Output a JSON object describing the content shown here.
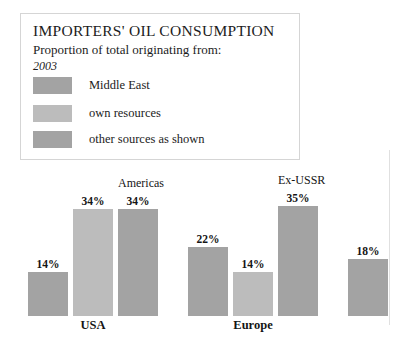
{
  "legend": {
    "title": "IMPORTERS' OIL CONSUMPTION",
    "subtitle": "Proportion of total originating from:",
    "year": "2003",
    "items": [
      {
        "label": "Middle East",
        "color": "#a3a3a3"
      },
      {
        "label": "own resources",
        "color": "#bcbcbc"
      },
      {
        "label": "other sources as shown",
        "color": "#a3a3a3"
      }
    ]
  },
  "chart_data": {
    "type": "bar",
    "title": "IMPORTERS' OIL CONSUMPTION",
    "subtitle": "Proportion of total originating from:",
    "year": "2003",
    "xlabel": "",
    "ylabel": "",
    "ylim": [
      0,
      40
    ],
    "grid": false,
    "legend_position": "top-left",
    "series": [
      {
        "name": "Middle East",
        "color": "#a3a3a3"
      },
      {
        "name": "own resources",
        "color": "#bcbcbc"
      },
      {
        "name": "other sources as shown",
        "color": "#a3a3a3"
      }
    ],
    "groups": [
      {
        "name": "USA",
        "bars": [
          {
            "value": 14,
            "label": "14%",
            "source": "Middle East",
            "top_label": "",
            "color": "#a3a3a3"
          },
          {
            "value": 34,
            "label": "34%",
            "source": "own resources",
            "top_label": "",
            "color": "#bcbcbc"
          },
          {
            "value": 34,
            "label": "34%",
            "source": "other sources as shown",
            "top_label": "Americas",
            "color": "#a3a3a3"
          }
        ]
      },
      {
        "name": "Europe",
        "bars": [
          {
            "value": 22,
            "label": "22%",
            "source": "Middle East",
            "top_label": "",
            "color": "#a3a3a3"
          },
          {
            "value": 14,
            "label": "14%",
            "source": "own resources",
            "top_label": "",
            "color": "#bcbcbc"
          },
          {
            "value": 35,
            "label": "35%",
            "source": "other sources as shown",
            "top_label": "Ex-USSR",
            "color": "#a3a3a3"
          }
        ]
      },
      {
        "name": "",
        "bars": [
          {
            "value": 18,
            "label": "18%",
            "source": "Middle East",
            "top_label": "",
            "color": "#a3a3a3"
          }
        ]
      }
    ]
  },
  "bars_layout": [
    {
      "x": 28,
      "w": 40,
      "value": 14,
      "label": "14%",
      "top_label": "",
      "color": "#a3a3a3"
    },
    {
      "x": 73,
      "w": 40,
      "value": 34,
      "label": "34%",
      "top_label": "",
      "color": "#bcbcbc"
    },
    {
      "x": 118,
      "w": 40,
      "value": 34,
      "label": "34%",
      "top_label": "Americas",
      "color": "#a3a3a3"
    },
    {
      "x": 188,
      "w": 40,
      "value": 22,
      "label": "22%",
      "top_label": "",
      "color": "#a3a3a3"
    },
    {
      "x": 233,
      "w": 40,
      "value": 14,
      "label": "14%",
      "top_label": "",
      "color": "#bcbcbc"
    },
    {
      "x": 278,
      "w": 40,
      "value": 35,
      "label": "35%",
      "top_label": "Ex-USSR",
      "color": "#a3a3a3"
    },
    {
      "x": 348,
      "w": 40,
      "value": 18,
      "label": "18%",
      "top_label": "",
      "color": "#a3a3a3"
    }
  ],
  "group_labels": [
    {
      "text": "USA",
      "x": 73,
      "w": 40
    },
    {
      "text": "Europe",
      "x": 233,
      "w": 40
    }
  ]
}
